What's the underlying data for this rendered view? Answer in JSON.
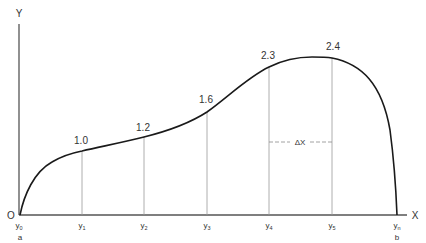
{
  "diagram": {
    "type": "area-under-curve-ordinates",
    "axes": {
      "y_label": "Y",
      "x_label": "X",
      "origin_label": "O"
    },
    "ordinates": [
      {
        "base": "y",
        "sub": "0",
        "value": null
      },
      {
        "base": "y",
        "sub": "1",
        "value": "1.0"
      },
      {
        "base": "y",
        "sub": "2",
        "value": "1.2"
      },
      {
        "base": "y",
        "sub": "3",
        "value": "1.6"
      },
      {
        "base": "y",
        "sub": "4",
        "value": "2.3"
      },
      {
        "base": "y",
        "sub": "5",
        "value": "2.4"
      },
      {
        "base": "y",
        "sub": "n",
        "value": null
      }
    ],
    "interval_label": "ΔX",
    "bound_start": "a",
    "bound_end": "b",
    "colors": {
      "curve": "#1a1a1a",
      "axis": "#444444",
      "ordinate_lines": "#9a9a9a",
      "text": "#333333"
    }
  }
}
